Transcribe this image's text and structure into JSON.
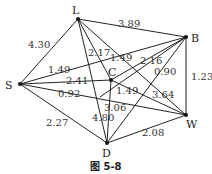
{
  "nodes": [
    {
      "id": "L",
      "label": "L",
      "x": 78,
      "y": 19,
      "lx": 72,
      "ly": 14
    },
    {
      "id": "B",
      "label": "B",
      "x": 186,
      "y": 37,
      "lx": 191,
      "ly": 42
    },
    {
      "id": "S",
      "label": "S",
      "x": 20,
      "y": 84,
      "lx": 5,
      "ly": 89
    },
    {
      "id": "C",
      "label": "C",
      "x": 111,
      "y": 80,
      "lx": 108,
      "ly": 76
    },
    {
      "id": "D",
      "label": "D",
      "x": 107,
      "y": 143,
      "lx": 102,
      "ly": 157
    },
    {
      "id": "W",
      "label": "W",
      "x": 186,
      "y": 115,
      "lx": 186,
      "ly": 128
    }
  ],
  "edges": [
    {
      "from": "S",
      "to": "L",
      "weight": "4.30",
      "lx": 28,
      "ly": 48
    },
    {
      "from": "L",
      "to": "B",
      "weight": "3.89",
      "lx": 118,
      "ly": 27
    },
    {
      "from": "S",
      "to": "B",
      "weight": "1.49",
      "lx": 48,
      "ly": 73
    },
    {
      "from": "S",
      "to": "C",
      "weight": "2.41",
      "lx": 66,
      "ly": 84
    },
    {
      "from": "S",
      "to": "W",
      "weight": "0.92",
      "lx": 58,
      "ly": 97
    },
    {
      "from": "S",
      "to": "D",
      "weight": "2.27",
      "lx": 46,
      "ly": 126
    },
    {
      "from": "L",
      "to": "C",
      "weight": "2.17",
      "lx": 88,
      "ly": 56
    },
    {
      "from": "L",
      "to": "W",
      "weight": "3.64",
      "lx": 152,
      "ly": 98
    },
    {
      "from": "L",
      "to": "D",
      "weight": "4.80",
      "lx": 92,
      "ly": 121
    },
    {
      "from": "C",
      "to": "B",
      "weight": "1.49",
      "lx": 110,
      "ly": 61
    },
    {
      "from": "C",
      "to": "W",
      "weight": "1.49",
      "lx": 116,
      "ly": 94
    },
    {
      "from": "C",
      "to": "D",
      "weight": "3.06",
      "lx": 104,
      "ly": 111
    },
    {
      "from": "B",
      "to": "D",
      "weight": "0.90",
      "lx": 154,
      "ly": 75
    },
    {
      "from": "B",
      "to": "C2",
      "weight": "2.16",
      "lx": 140,
      "ly": 64
    },
    {
      "from": "B",
      "to": "W",
      "weight": "1.23",
      "lx": 191,
      "ly": 80
    },
    {
      "from": "D",
      "to": "W",
      "weight": "2.08",
      "lx": 142,
      "ly": 136
    }
  ],
  "caption": "图 5-8"
}
